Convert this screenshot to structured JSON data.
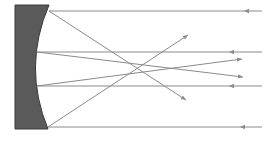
{
  "diagram": {
    "colors": {
      "background": "#ffffff",
      "mirror_fill": "#5a5a5a",
      "mirror_stroke": "#3a3a3a",
      "ray": "#8a8a8a"
    },
    "mirror": {
      "back_x": 15,
      "top_y": 5,
      "bottom_y": 129,
      "top_front_x": 49,
      "bottom_front_x": 48,
      "mid_front_x": 35
    },
    "focal_point": {
      "x": 138,
      "y": 68
    },
    "incident_rays": [
      {
        "y": 11,
        "x_start": 262,
        "x_end": 49,
        "arrow_x": 244,
        "direction": "left"
      },
      {
        "y": 52,
        "x_start": 262,
        "x_end": 37,
        "arrow_x": 229,
        "direction": "left"
      },
      {
        "y": 86,
        "x_start": 262,
        "x_end": 37,
        "arrow_x": 229,
        "direction": "left"
      },
      {
        "y": 127,
        "x_start": 262,
        "x_end": 48,
        "arrow_x": 240,
        "direction": "left"
      }
    ],
    "reflected_rays": [
      {
        "from": [
          49,
          11
        ],
        "to": [
          186,
          100
        ],
        "direction": "right"
      },
      {
        "from": [
          37,
          52
        ],
        "to": [
          243,
          77
        ],
        "direction": "right"
      },
      {
        "from": [
          37,
          86
        ],
        "to": [
          242,
          59
        ],
        "direction": "right"
      },
      {
        "from": [
          48,
          127
        ],
        "to": [
          188,
          35
        ],
        "direction": "right"
      }
    ]
  }
}
